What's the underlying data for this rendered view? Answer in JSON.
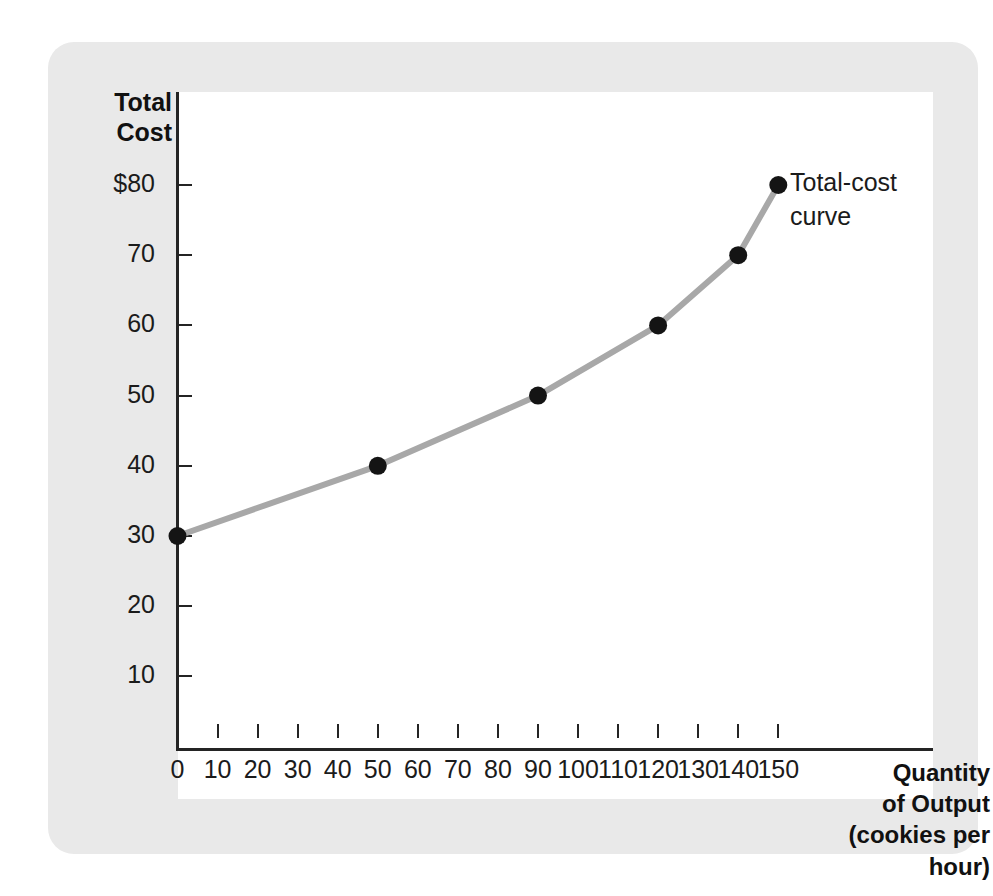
{
  "chart_data": {
    "type": "line",
    "title": "",
    "xlabel": "Quantity\nof Output\n(cookies per hour)",
    "ylabel": "Total\nCost",
    "x": [
      0,
      50,
      90,
      120,
      140,
      150
    ],
    "values": [
      30,
      40,
      50,
      60,
      70,
      80
    ],
    "series": [
      {
        "name": "Total-cost curve",
        "x": [
          0,
          50,
          90,
          120,
          140,
          150
        ],
        "values": [
          30,
          40,
          50,
          60,
          70,
          80
        ]
      }
    ],
    "xlim": [
      0,
      155
    ],
    "ylim": [
      0,
      90
    ],
    "x_ticks": [
      0,
      10,
      20,
      30,
      40,
      50,
      60,
      70,
      80,
      90,
      100,
      110,
      120,
      130,
      140,
      150
    ],
    "x_tick_labels": [
      "0",
      "10",
      "20",
      "30",
      "40",
      "50",
      "60",
      "70",
      "80",
      "90",
      "100",
      "110",
      "120",
      "130",
      "140",
      "150"
    ],
    "y_ticks": [
      10,
      20,
      30,
      40,
      50,
      60,
      70,
      80
    ],
    "y_tick_labels": [
      "10",
      "20",
      "30",
      "40",
      "50",
      "60",
      "70",
      "$80"
    ],
    "grid": false,
    "legend": "none",
    "annotations": [
      {
        "text": "Total-cost\ncurve",
        "x": 150,
        "y": 80
      }
    ],
    "colors": {
      "curve": "#a8a8a8",
      "marker": "#141414",
      "axis": "#242424",
      "card_background": "#e9e9e9",
      "plot_background": "#ffffff",
      "text": "#1b1b1b"
    }
  },
  "axes": {
    "y_title": "Total\nCost",
    "x_title": "Quantity\nof Output\n(cookies per hour)"
  },
  "annotation": {
    "curve_label": "Total-cost\ncurve"
  }
}
